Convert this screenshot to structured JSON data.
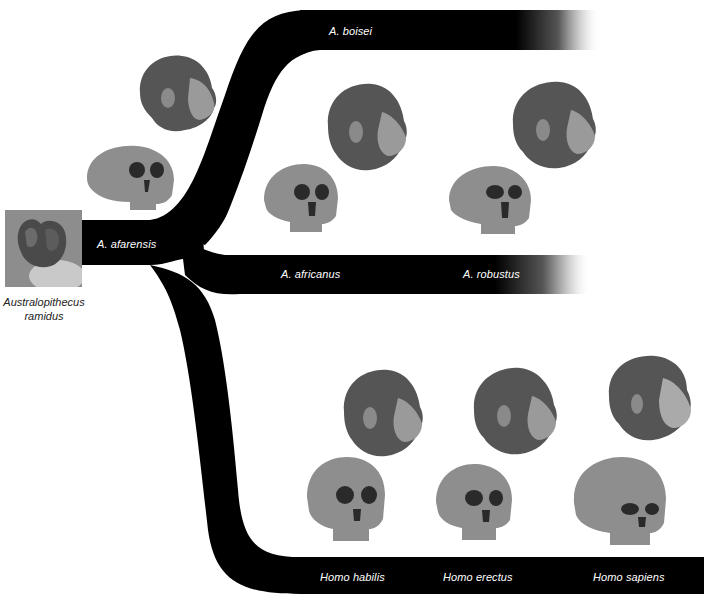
{
  "ancestor": {
    "caption_line1": "Australopithecus",
    "caption_line2": "ramidus",
    "image": "fossil-in-hand-photo"
  },
  "branches": {
    "stem": {
      "label": "A. afarensis"
    },
    "upper": {
      "label": "A. boisei"
    },
    "middle": {
      "labels": [
        "A. africanus",
        "A. robustus"
      ]
    },
    "lower": {
      "labels": [
        "Homo habilis",
        "Homo erectus",
        "Homo sapiens"
      ]
    }
  },
  "figures": [
    {
      "species": "A. afarensis",
      "items": [
        "head-illustration",
        "skull-illustration"
      ]
    },
    {
      "species": "A. africanus",
      "items": [
        "head-illustration",
        "skull-illustration"
      ]
    },
    {
      "species": "A. robustus",
      "items": [
        "head-illustration",
        "skull-illustration"
      ]
    },
    {
      "species": "Homo habilis",
      "items": [
        "head-illustration",
        "skull-illustration"
      ]
    },
    {
      "species": "Homo erectus",
      "items": [
        "head-illustration",
        "skull-illustration"
      ]
    },
    {
      "species": "Homo sapiens",
      "items": [
        "head-illustration",
        "skull-illustration"
      ]
    }
  ],
  "colors": {
    "branch": "#000000",
    "label": "#ffffff",
    "background": "#ffffff"
  }
}
